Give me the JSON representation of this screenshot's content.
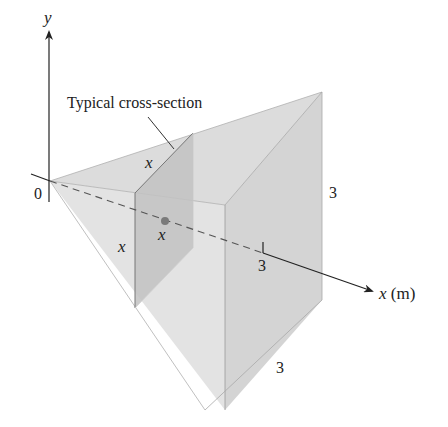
{
  "figure": {
    "type": "3D solid with triangular cross-sections",
    "axis_labels": {
      "y": "y",
      "x": "x (m)",
      "origin": "0"
    },
    "annotation": "Typical cross-section",
    "cross_section_labels": {
      "top_edge": "x",
      "left_edge": "x",
      "position": "x"
    },
    "dimension_labels": {
      "x_tick": "3",
      "height": "3",
      "base": "3"
    },
    "colors": {
      "solid_fill": "#d6d6d6",
      "cross_section_fill": "#b8b8b8",
      "edge": "#8a8a8a",
      "axis": "#222222",
      "dot": "#7a7a7a"
    }
  }
}
